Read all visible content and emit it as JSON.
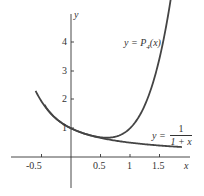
{
  "chart_data": {
    "type": "line",
    "title": "",
    "xlabel": "x",
    "ylabel": "y",
    "x_ticks": [
      "-0.5",
      "0.5",
      "1",
      "1.5"
    ],
    "y_ticks": [
      "1",
      "2",
      "3",
      "4"
    ],
    "xlim": [
      -0.55,
      1.85
    ],
    "ylim": [
      -0.7,
      5.3
    ],
    "grid": false,
    "series": [
      {
        "name": "y = 1/(1+x)",
        "label_prefix": "y =",
        "label_num": "1",
        "label_den": "1 + x",
        "x": [
          -0.45,
          -0.3,
          0,
          0.5,
          1,
          1.5,
          1.85
        ],
        "values": [
          1.82,
          1.43,
          1,
          0.67,
          0.5,
          0.4,
          0.35
        ]
      },
      {
        "name": "y = P4(x)",
        "label": "y = P4(x)",
        "x": [
          -0.6,
          -0.5,
          0,
          0.5,
          0.7,
          1,
          1.5,
          1.75
        ],
        "values": [
          2.45,
          1.94,
          1,
          0.69,
          0.68,
          1,
          3.44,
          5.2
        ]
      }
    ]
  },
  "labels": {
    "y_axis": "y",
    "x_axis": "x",
    "p4_label_a": "y = P",
    "p4_sub": "4",
    "p4_label_b": "(x)",
    "recip_prefix": "y =",
    "recip_num": "1",
    "recip_den": "1 + x"
  }
}
